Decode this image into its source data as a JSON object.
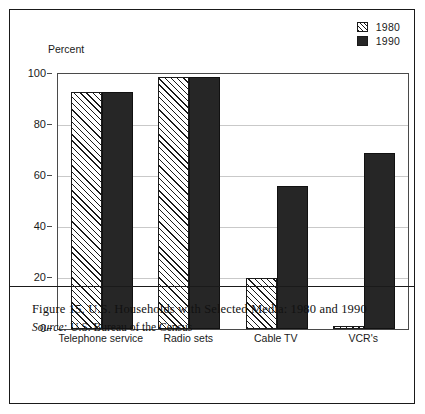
{
  "figure": {
    "axis_title": "Percent",
    "caption_title": "Figure 15. U.S. Households with Selected Media: 1980 and 1990",
    "source_label": "Source:",
    "source_text": "U.S. Bureau of the Census"
  },
  "legend": {
    "entries": [
      {
        "label": "1980",
        "swatch": "hatched-square-icon"
      },
      {
        "label": "1990",
        "swatch": "solid-square-icon"
      }
    ]
  },
  "colors": {
    "bar_1980_fill": "#fdfdfd",
    "bar_1980_hatch": "#1a1a1a",
    "bar_1990_fill": "#262626",
    "grid": "#c9c9c9",
    "axis": "#4a4a4a",
    "frame": "#1a1a1a"
  },
  "chart_data": {
    "type": "bar",
    "title": "Figure 15. U.S. Households with Selected Media: 1980 and 1990",
    "xlabel": "",
    "ylabel": "Percent",
    "ylim": [
      0,
      100
    ],
    "yticks": [
      0,
      20,
      40,
      60,
      80,
      100
    ],
    "ytick_labels": [
      "0",
      "20",
      "40",
      "60",
      "80",
      "100"
    ],
    "grid": true,
    "legend_position": "top-right",
    "categories": [
      "Telephone service",
      "Radio sets",
      "Cable TV",
      "VCR's"
    ],
    "series": [
      {
        "name": "1980",
        "values": [
          93,
          99,
          20,
          1
        ]
      },
      {
        "name": "1990",
        "values": [
          93,
          99,
          56,
          69
        ]
      }
    ]
  }
}
